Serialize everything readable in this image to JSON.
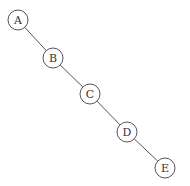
{
  "diagram": {
    "type": "linked-list-tree",
    "nodes": [
      {
        "id": "A",
        "label": "A",
        "x": 18,
        "y": 20
      },
      {
        "id": "B",
        "label": "B",
        "x": 53,
        "y": 58
      },
      {
        "id": "C",
        "label": "C",
        "x": 90,
        "y": 94
      },
      {
        "id": "D",
        "label": "D",
        "x": 127,
        "y": 132
      },
      {
        "id": "E",
        "label": "E",
        "x": 165,
        "y": 168
      }
    ],
    "edges": [
      {
        "from": "A",
        "to": "B"
      },
      {
        "from": "B",
        "to": "C"
      },
      {
        "from": "C",
        "to": "D"
      },
      {
        "from": "D",
        "to": "E"
      }
    ]
  }
}
